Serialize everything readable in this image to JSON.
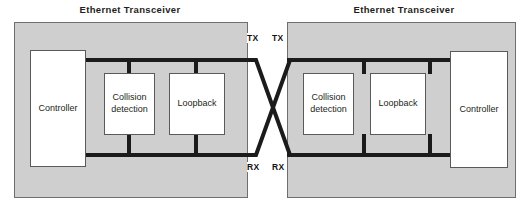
{
  "diagram": {
    "type": "block-diagram",
    "colors": {
      "panel_fill": "#cfcfcf",
      "panel_border": "#6e6e6e",
      "box_fill": "#ffffff",
      "box_border": "#5a5a5a",
      "bus_line": "#1b1b1b",
      "text": "#231f20",
      "background": "#ffffff"
    }
  },
  "left_transceiver": {
    "title": "Ethernet Transceiver",
    "controller": "Controller",
    "collision_detection": "Collision detection",
    "collision_detection_line1": "Collision",
    "collision_detection_line2": "detection",
    "loopback": "Loopback",
    "tx_label": "TX",
    "rx_label": "RX"
  },
  "right_transceiver": {
    "title": "Ethernet Transceiver",
    "controller": "Controller",
    "collision_detection": "Collision detection",
    "collision_detection_line1": "Collision",
    "collision_detection_line2": "detection",
    "loopback": "Loopback",
    "tx_label": "TX",
    "rx_label": "RX"
  }
}
